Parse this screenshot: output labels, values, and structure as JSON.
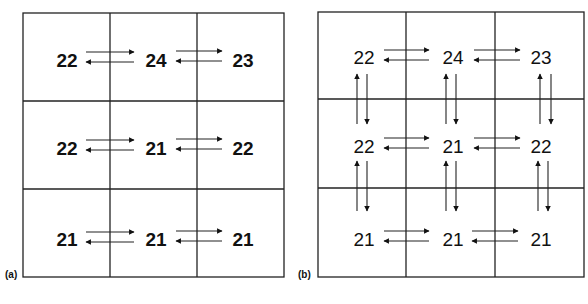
{
  "panels": [
    {
      "label": "(a)",
      "grid": [
        [
          "22",
          "24",
          "23"
        ],
        [
          "22",
          "21",
          "22"
        ],
        [
          "21",
          "21",
          "21"
        ]
      ],
      "arrows": "horizontal-only"
    },
    {
      "label": "(b)",
      "grid": [
        [
          "22",
          "24",
          "23"
        ],
        [
          "22",
          "21",
          "22"
        ],
        [
          "21",
          "21",
          "21"
        ]
      ],
      "arrows": "horizontal-and-vertical"
    }
  ],
  "colors": {
    "line": "#222222",
    "text": "#111111",
    "background": "#ffffff"
  }
}
